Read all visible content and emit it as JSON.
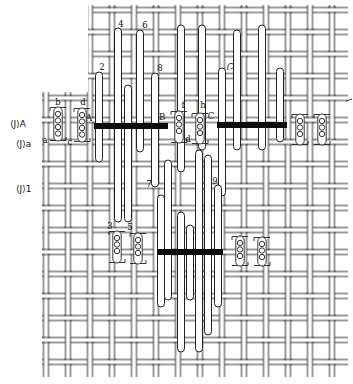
{
  "diagram": {
    "canvas": {
      "width": 353,
      "height": 384
    },
    "colors": {
      "ink": "#222222",
      "bar": "#0d0d0d",
      "paper": "#ffffff"
    },
    "row_labels": [
      {
        "text": "⟨J⟩A",
        "x": 10,
        "y": 127
      },
      {
        "text": "⟨J⟩a",
        "x": 16,
        "y": 147
      },
      {
        "text": "⟨J⟩1",
        "x": 16,
        "y": 192
      }
    ],
    "point_labels": [
      {
        "text": "2",
        "x": 102,
        "y": 70
      },
      {
        "text": "4",
        "x": 121,
        "y": 27
      },
      {
        "text": "6",
        "x": 145,
        "y": 28
      },
      {
        "text": "8",
        "x": 160,
        "y": 71
      },
      {
        "text": "b",
        "x": 58,
        "y": 105
      },
      {
        "text": "d",
        "x": 83,
        "y": 105
      },
      {
        "text": "a",
        "x": 45,
        "y": 143
      },
      {
        "text": "c",
        "x": 70,
        "y": 145
      },
      {
        "text": "A",
        "x": 89,
        "y": 121
      },
      {
        "text": "B",
        "x": 162,
        "y": 120
      },
      {
        "text": "C",
        "x": 211,
        "y": 119
      },
      {
        "text": "f",
        "x": 183,
        "y": 108
      },
      {
        "text": "h",
        "x": 203,
        "y": 108
      },
      {
        "text": "d",
        "x": 188,
        "y": 142
      },
      {
        "text": "7",
        "x": 149,
        "y": 187
      },
      {
        "text": "9",
        "x": 215,
        "y": 184
      },
      {
        "text": "3",
        "x": 110,
        "y": 229
      },
      {
        "text": "5",
        "x": 130,
        "y": 230
      }
    ],
    "weft_bars": [
      {
        "x": 94,
        "y": 123,
        "width": 74,
        "height": 6
      },
      {
        "x": 217,
        "y": 122,
        "width": 70,
        "height": 6
      },
      {
        "x": 157,
        "y": 249,
        "width": 66,
        "height": 6
      }
    ],
    "float_threads": [
      {
        "x": 99,
        "y1": 72,
        "y2": 162
      },
      {
        "x": 118,
        "y1": 28,
        "y2": 222
      },
      {
        "x": 128,
        "y1": 85,
        "y2": 222
      },
      {
        "x": 140,
        "y1": 30,
        "y2": 152
      },
      {
        "x": 155,
        "y1": 73,
        "y2": 187
      },
      {
        "x": 181,
        "y1": 25,
        "y2": 172
      },
      {
        "x": 202,
        "y1": 25,
        "y2": 150
      },
      {
        "x": 222,
        "y1": 68,
        "y2": 196
      },
      {
        "x": 237,
        "y1": 30,
        "y2": 150
      },
      {
        "x": 262,
        "y1": 25,
        "y2": 150
      },
      {
        "x": 280,
        "y1": 68,
        "y2": 142
      },
      {
        "x": 161,
        "y1": 195,
        "y2": 307
      },
      {
        "x": 168,
        "y1": 160,
        "y2": 300
      },
      {
        "x": 181,
        "y1": 212,
        "y2": 352
      },
      {
        "x": 190,
        "y1": 225,
        "y2": 300
      },
      {
        "x": 199,
        "y1": 150,
        "y2": 352
      },
      {
        "x": 208,
        "y1": 155,
        "y2": 335
      },
      {
        "x": 218,
        "y1": 185,
        "y2": 307
      }
    ],
    "coils": [
      {
        "x": 58,
        "y1": 107,
        "y2": 141
      },
      {
        "x": 82,
        "y1": 108,
        "y2": 142
      },
      {
        "x": 179,
        "y1": 111,
        "y2": 143
      },
      {
        "x": 200,
        "y1": 113,
        "y2": 144
      },
      {
        "x": 300,
        "y1": 114,
        "y2": 145
      },
      {
        "x": 322,
        "y1": 114,
        "y2": 145
      },
      {
        "x": 117,
        "y1": 231,
        "y2": 263
      },
      {
        "x": 138,
        "y1": 233,
        "y2": 264
      },
      {
        "x": 240,
        "y1": 236,
        "y2": 266
      },
      {
        "x": 262,
        "y1": 237,
        "y2": 266
      }
    ]
  }
}
